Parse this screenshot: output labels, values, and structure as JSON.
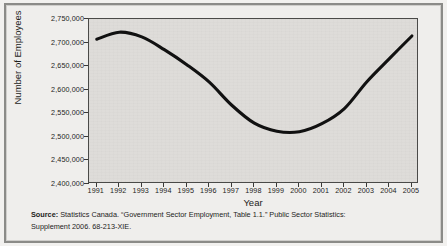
{
  "chart_data": {
    "type": "line",
    "title": "",
    "xlabel": "Year",
    "ylabel": "Number of Employees",
    "xlim": [
      1991,
      2005
    ],
    "ylim": [
      2400000,
      2750000
    ],
    "grid": false,
    "legend": "none",
    "x": [
      1991,
      1992,
      1993,
      1994,
      1995,
      1996,
      1997,
      1998,
      1999,
      2000,
      2001,
      2002,
      2003,
      2004,
      2005
    ],
    "categories": [
      "1991",
      "1992",
      "1993",
      "1994",
      "1995",
      "1996",
      "1997",
      "1998",
      "1999",
      "2000",
      "2001",
      "2002",
      "2003",
      "2004",
      "2005"
    ],
    "values": [
      2707000,
      2722000,
      2712000,
      2685000,
      2653000,
      2616000,
      2567000,
      2529000,
      2512000,
      2511000,
      2528000,
      2560000,
      2617000,
      2666000,
      2714000
    ],
    "series": [
      {
        "name": "Government sector employment",
        "values": [
          2707000,
          2722000,
          2712000,
          2685000,
          2653000,
          2616000,
          2567000,
          2529000,
          2512000,
          2511000,
          2528000,
          2560000,
          2617000,
          2666000,
          2714000
        ],
        "color": "#111111"
      }
    ],
    "ytick_labels": [
      "2,750,000",
      "2,700,000",
      "2,650,000",
      "2,600,000",
      "2,550,000",
      "2,500,000",
      "2,450,000",
      "2,400,000"
    ],
    "ytick_values": [
      2750000,
      2700000,
      2650000,
      2600000,
      2550000,
      2500000,
      2450000,
      2400000
    ],
    "colors": {
      "plot_background": "#dedcd9",
      "axis": "#3a3a38",
      "line": "#111111",
      "page_background": "#efeeec",
      "frame": "#8b8b88",
      "text": "#1d1d1b"
    }
  },
  "source": {
    "label": "Source:",
    "line1": " Statistics Canada. “Government Sector Employment, Table 1.1.” Public Sector Statistics:",
    "line2": "Supplement 2006. 68-213-XIE."
  }
}
